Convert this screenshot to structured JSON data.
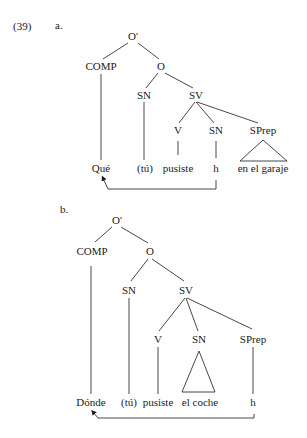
{
  "example_number": "(39)",
  "trees": [
    {
      "label": "a.",
      "nodes": {
        "root": "O'",
        "comp": "COMP",
        "o": "O",
        "sn_subj": "SN",
        "sv": "SV",
        "v": "V",
        "sn_obj": "SN",
        "sprep": "SPrep"
      },
      "leaves": {
        "comp": "Qué",
        "subj": "(tú)",
        "verb": "pusiste",
        "obj": "h",
        "pp": "en el garaje"
      },
      "movement": {
        "from": "h",
        "to": "Qué"
      }
    },
    {
      "label": "b.",
      "nodes": {
        "root": "O'",
        "comp": "COMP",
        "o": "O",
        "sn_subj": "SN",
        "sv": "SV",
        "v": "V",
        "sn_obj": "SN",
        "sprep": "SPrep"
      },
      "leaves": {
        "comp": "Dónde",
        "subj": "(tú)",
        "verb": "pusiste",
        "obj": "el coche",
        "pp": "h"
      },
      "movement": {
        "from": "h",
        "to": "Dónde"
      }
    }
  ]
}
